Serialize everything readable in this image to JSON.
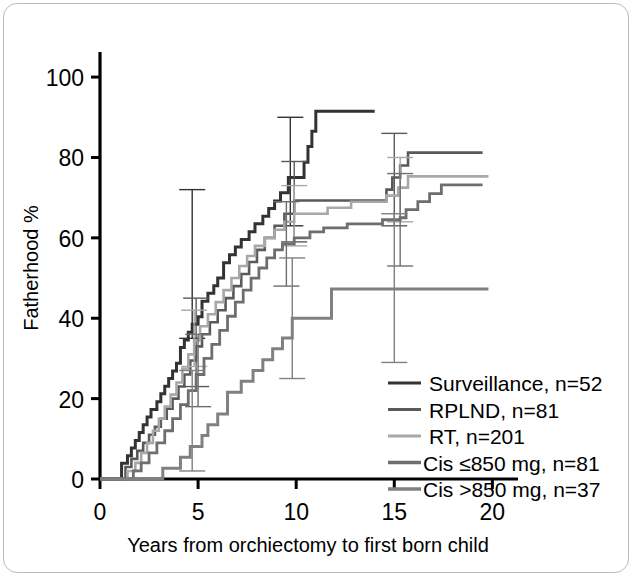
{
  "figure": {
    "name": "fatherhood-kaplan-meier",
    "background": "#ffffff",
    "border_color": "#b9b9b9"
  },
  "chart_data": {
    "type": "line",
    "title": "",
    "subtitle": "",
    "xlabel": "Years from orchiectomy to first born child",
    "ylabel": "Fatherhood %",
    "xlim": [
      0,
      21
    ],
    "ylim": [
      0,
      105
    ],
    "xticks": [
      0,
      5,
      10,
      15,
      20
    ],
    "xticklabels": [
      "0",
      "5",
      "10",
      "15",
      "20"
    ],
    "yticks": [
      0,
      20,
      40,
      60,
      80,
      100
    ],
    "yticklabels": [
      "0",
      "20",
      "40",
      "60",
      "80",
      "100"
    ],
    "grid": false,
    "legend_position": "lower-right",
    "step_type": "post",
    "series": [
      {
        "name": "Surveillance",
        "label": "Surveillance, n=52",
        "n": 52,
        "color": "#333333",
        "width": 3.0,
        "points": [
          [
            0,
            0
          ],
          [
            1.0,
            0
          ],
          [
            1.1,
            3.9
          ],
          [
            1.4,
            5.8
          ],
          [
            1.6,
            7.7
          ],
          [
            1.8,
            9.6
          ],
          [
            2.0,
            11.6
          ],
          [
            2.2,
            13.5
          ],
          [
            2.4,
            15.4
          ],
          [
            2.6,
            17.3
          ],
          [
            2.9,
            19.2
          ],
          [
            3.1,
            21.2
          ],
          [
            3.3,
            23.1
          ],
          [
            3.5,
            25.0
          ],
          [
            3.7,
            26.9
          ],
          [
            3.9,
            28.8
          ],
          [
            4.1,
            32.7
          ],
          [
            4.3,
            34.6
          ],
          [
            4.5,
            36.5
          ],
          [
            4.7,
            38.5
          ],
          [
            5.0,
            40.4
          ],
          [
            5.2,
            44.2
          ],
          [
            5.5,
            46.2
          ],
          [
            5.8,
            48.1
          ],
          [
            6.0,
            50.0
          ],
          [
            6.3,
            53.8
          ],
          [
            6.6,
            55.8
          ],
          [
            6.9,
            57.7
          ],
          [
            7.2,
            59.6
          ],
          [
            7.6,
            61.5
          ],
          [
            7.9,
            63.5
          ],
          [
            8.3,
            65.4
          ],
          [
            8.6,
            67.3
          ],
          [
            8.9,
            69.2
          ],
          [
            9.2,
            71.2
          ],
          [
            9.6,
            75.0
          ],
          [
            10.3,
            75.0
          ],
          [
            10.4,
            78.8
          ],
          [
            10.6,
            82.7
          ],
          [
            10.8,
            86.5
          ],
          [
            11.0,
            91.5
          ],
          [
            14.0,
            91.5
          ]
        ],
        "errorbars": [
          {
            "x": 4.7,
            "y": 40.4,
            "low": 35.0,
            "high": 72.0
          },
          {
            "x": 9.7,
            "y": 75.0,
            "low": 63.0,
            "high": 90.0
          }
        ]
      },
      {
        "name": "RPLND",
        "label": "RPLND, n=81",
        "n": 81,
        "color": "#5a5a5a",
        "width": 2.6,
        "points": [
          [
            0,
            0
          ],
          [
            1.2,
            0
          ],
          [
            1.3,
            3.0
          ],
          [
            1.6,
            5.0
          ],
          [
            1.9,
            7.0
          ],
          [
            2.2,
            9.0
          ],
          [
            2.5,
            11.0
          ],
          [
            2.8,
            13.0
          ],
          [
            3.1,
            15.0
          ],
          [
            3.4,
            17.5
          ],
          [
            3.7,
            20.0
          ],
          [
            4.0,
            23.0
          ],
          [
            4.3,
            26.0
          ],
          [
            4.6,
            29.5
          ],
          [
            4.9,
            33.0
          ],
          [
            5.2,
            36.0
          ],
          [
            5.6,
            39.0
          ],
          [
            6.0,
            42.0
          ],
          [
            6.4,
            45.0
          ],
          [
            6.8,
            48.0
          ],
          [
            7.2,
            51.0
          ],
          [
            7.6,
            54.0
          ],
          [
            8.0,
            57.0
          ],
          [
            8.4,
            60.0
          ],
          [
            8.9,
            63.0
          ],
          [
            9.4,
            66.0
          ],
          [
            9.9,
            69.3
          ],
          [
            14.3,
            69.3
          ],
          [
            14.6,
            72.0
          ],
          [
            14.9,
            75.0
          ],
          [
            15.3,
            78.0
          ],
          [
            15.7,
            81.2
          ],
          [
            19.5,
            81.2
          ]
        ],
        "errorbars": [
          {
            "x": 4.9,
            "y": 33.0,
            "low": 23.0,
            "high": 45.0
          },
          {
            "x": 9.9,
            "y": 69.3,
            "low": 59.0,
            "high": 79.0
          },
          {
            "x": 15.0,
            "y": 75.0,
            "low": 63.0,
            "high": 86.0
          }
        ]
      },
      {
        "name": "RT",
        "label": "RT, n=201",
        "n": 201,
        "color": "#a8a8a8",
        "width": 2.6,
        "points": [
          [
            0,
            0
          ],
          [
            1.3,
            0
          ],
          [
            1.4,
            2.0
          ],
          [
            1.8,
            4.0
          ],
          [
            2.1,
            6.5
          ],
          [
            2.4,
            9.0
          ],
          [
            2.7,
            12.0
          ],
          [
            3.0,
            15.0
          ],
          [
            3.3,
            18.0
          ],
          [
            3.6,
            21.0
          ],
          [
            3.9,
            24.0
          ],
          [
            4.2,
            27.5
          ],
          [
            4.5,
            31.0
          ],
          [
            4.8,
            34.5
          ],
          [
            5.1,
            38.0
          ],
          [
            5.5,
            41.0
          ],
          [
            5.9,
            44.0
          ],
          [
            6.3,
            47.0
          ],
          [
            6.7,
            50.0
          ],
          [
            7.1,
            53.0
          ],
          [
            7.5,
            55.5
          ],
          [
            7.9,
            58.0
          ],
          [
            8.4,
            60.0
          ],
          [
            8.9,
            62.0
          ],
          [
            9.4,
            64.0
          ],
          [
            9.9,
            66.0
          ],
          [
            11.6,
            67.5
          ],
          [
            12.8,
            69.0
          ],
          [
            14.6,
            70.5
          ],
          [
            15.2,
            72.5
          ],
          [
            15.7,
            75.3
          ],
          [
            19.8,
            75.3
          ]
        ],
        "errorbars": [
          {
            "x": 4.8,
            "y": 34.5,
            "low": 28.0,
            "high": 42.0
          },
          {
            "x": 9.9,
            "y": 66.0,
            "low": 58.0,
            "high": 73.0
          },
          {
            "x": 15.3,
            "y": 72.5,
            "low": 64.0,
            "high": 80.0
          }
        ]
      },
      {
        "name": "Cis <=850 mg",
        "label": "Cis  ≤850 mg, n=81",
        "n": 81,
        "color": "#6e6e6e",
        "width": 2.8,
        "points": [
          [
            0,
            0
          ],
          [
            1.5,
            0
          ],
          [
            1.7,
            2.0
          ],
          [
            2.1,
            4.0
          ],
          [
            2.5,
            6.5
          ],
          [
            2.9,
            9.0
          ],
          [
            3.3,
            12.0
          ],
          [
            3.7,
            15.0
          ],
          [
            4.1,
            18.5
          ],
          [
            4.5,
            22.0
          ],
          [
            4.9,
            26.0
          ],
          [
            5.3,
            30.0
          ],
          [
            5.7,
            33.5
          ],
          [
            6.1,
            37.0
          ],
          [
            6.5,
            40.5
          ],
          [
            6.9,
            44.0
          ],
          [
            7.3,
            47.0
          ],
          [
            7.7,
            50.0
          ],
          [
            8.1,
            52.5
          ],
          [
            8.5,
            55.0
          ],
          [
            8.9,
            57.0
          ],
          [
            9.3,
            58.5
          ],
          [
            9.9,
            60.0
          ],
          [
            10.7,
            61.5
          ],
          [
            11.4,
            62.5
          ],
          [
            12.6,
            63.5
          ],
          [
            14.4,
            64.5
          ],
          [
            15.3,
            65.0
          ],
          [
            15.6,
            67.0
          ],
          [
            16.2,
            69.0
          ],
          [
            16.8,
            71.0
          ],
          [
            17.4,
            73.2
          ],
          [
            19.5,
            73.2
          ]
        ],
        "errorbars": [
          {
            "x": 5.0,
            "y": 27.0,
            "low": 18.0,
            "high": 36.0
          },
          {
            "x": 9.5,
            "y": 58.5,
            "low": 48.0,
            "high": 69.0
          },
          {
            "x": 15.3,
            "y": 65.0,
            "low": 53.0,
            "high": 76.0
          }
        ]
      },
      {
        "name": "Cis >850 mg",
        "label": "Cis  >850 mg, n=37",
        "n": 37,
        "color": "#808080",
        "width": 3.0,
        "points": [
          [
            0,
            0
          ],
          [
            3.0,
            0
          ],
          [
            3.2,
            2.7
          ],
          [
            3.9,
            2.7
          ],
          [
            4.1,
            5.4
          ],
          [
            4.6,
            8.1
          ],
          [
            5.2,
            10.8
          ],
          [
            5.5,
            13.5
          ],
          [
            6.0,
            16.2
          ],
          [
            6.5,
            21.6
          ],
          [
            7.2,
            24.3
          ],
          [
            7.8,
            27.0
          ],
          [
            8.3,
            29.7
          ],
          [
            8.8,
            32.4
          ],
          [
            9.3,
            35.1
          ],
          [
            9.8,
            40.0
          ],
          [
            11.6,
            40.0
          ],
          [
            11.8,
            47.3
          ],
          [
            19.8,
            47.3
          ]
        ],
        "errorbars": [
          {
            "x": 4.7,
            "y": 5.4,
            "low": 2.0,
            "high": 27.0
          },
          {
            "x": 9.8,
            "y": 40.0,
            "low": 25.0,
            "high": 55.0
          },
          {
            "x": 15.0,
            "y": 47.3,
            "low": 29.0,
            "high": 66.0
          }
        ]
      }
    ]
  },
  "legend": {
    "items": [
      {
        "label": "Surveillance, n=52",
        "color": "#333333"
      },
      {
        "label": "RPLND, n=81",
        "color": "#5a5a5a"
      },
      {
        "label": "RT, n=201",
        "color": "#a8a8a8"
      },
      {
        "label": "Cis  ≤850 mg, n=81",
        "color": "#6e6e6e"
      },
      {
        "label": "Cis  >850 mg, n=37",
        "color": "#808080"
      }
    ]
  }
}
